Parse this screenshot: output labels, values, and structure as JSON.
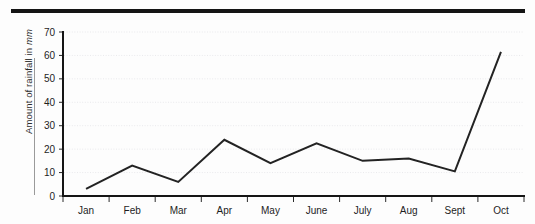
{
  "figure": {
    "top_rule": "horizontal-rule",
    "y_axis_title_main": "Amount of rainfall in ",
    "y_axis_title_unit": "mm"
  },
  "chart_data": {
    "type": "line",
    "title": "",
    "xlabel": "",
    "ylabel": "Amount of rainfall in mm",
    "categories": [
      "Jan",
      "Feb",
      "Mar",
      "Apr",
      "May",
      "June",
      "July",
      "Aug",
      "Sept",
      "Oct"
    ],
    "values": [
      3,
      13,
      6,
      24,
      14,
      22.5,
      15,
      16,
      10.5,
      61.5
    ],
    "ylim": [
      0,
      70
    ],
    "ytick_labels": [
      "0",
      "10",
      "20",
      "30",
      "40",
      "50",
      "60",
      "70"
    ],
    "ytick_values": [
      0,
      10,
      20,
      30,
      40,
      50,
      60,
      70
    ],
    "grid": true,
    "legend": "none",
    "line_color": "#232323",
    "grid_color": "#e9e9ec",
    "axis_color": "#151515"
  }
}
